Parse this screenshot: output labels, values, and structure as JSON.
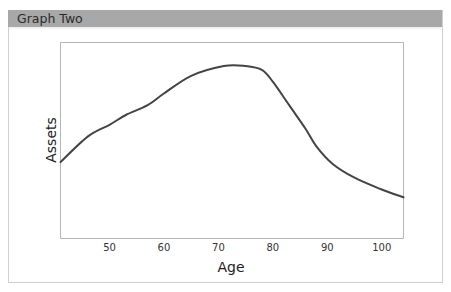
{
  "panel": {
    "title": "Graph Two"
  },
  "chart_data": {
    "type": "line",
    "title": "Graph Two",
    "xlabel": "Age",
    "ylabel": "Assets",
    "x_ticks": [
      50,
      60,
      70,
      80,
      90,
      100
    ],
    "y_ticks": [],
    "xlim": [
      41,
      104
    ],
    "ylim": [
      0,
      100
    ],
    "grid": false,
    "legend": null,
    "series": [
      {
        "name": "Assets",
        "color": "#444444",
        "x": [
          41,
          46,
          50,
          53,
          57,
          60,
          65,
          71,
          75,
          78,
          80,
          83,
          86,
          88,
          91,
          95,
          100,
          104
        ],
        "y": [
          39,
          52,
          58,
          63,
          68,
          74,
          83,
          88,
          88,
          86,
          80,
          68,
          56,
          47,
          38,
          31,
          25,
          21
        ]
      }
    ]
  },
  "colors": {
    "header_bg": "#a8a8a8",
    "line": "#444444",
    "frame": "#b5b5b5"
  }
}
